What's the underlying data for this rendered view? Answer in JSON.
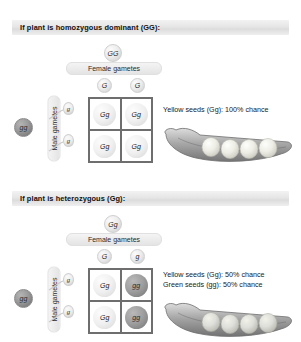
{
  "meta": {
    "background": "#ffffff",
    "header_bar_color": "#e6e6e6",
    "grid_line_color": "#6e6e6e",
    "dominant_allele_fill": "#ececec",
    "recessive_allele_fill": "#9a9a9a"
  },
  "panels": [
    {
      "id": "homozygous-dominant",
      "header": "If plant is homozygous dominant (GG):",
      "header_plain": "If plant is homozygous dominant (GG):",
      "female": {
        "parent_genotype": "GG",
        "parent_shade": "light",
        "label": "Female gametes",
        "gametes": [
          {
            "allele": "G",
            "shade": "light"
          },
          {
            "allele": "G",
            "shade": "light"
          }
        ]
      },
      "male": {
        "parent_genotype": "gg",
        "parent_shade": "dark",
        "label": "Male gametes",
        "gametes": [
          {
            "allele": "g",
            "shade": "light"
          },
          {
            "allele": "g",
            "shade": "light"
          }
        ]
      },
      "punnett": {
        "rows": [
          [
            {
              "genotype": "Gg",
              "shade": "light"
            },
            {
              "genotype": "Gg",
              "shade": "light"
            }
          ],
          [
            {
              "genotype": "Gg",
              "shade": "light"
            },
            {
              "genotype": "Gg",
              "shade": "light"
            }
          ]
        ]
      },
      "results": [
        {
          "text": "Yellow seeds (Gg): 100% chance",
          "phenotype": "Yellow seeds",
          "genotype": "Gg",
          "chance": "100%"
        }
      ],
      "pod": {
        "seed_count": 4,
        "seed_shade": "yellow"
      }
    },
    {
      "id": "heterozygous",
      "header": "If plant is heterozygous (Gg):",
      "header_plain": "If plant is heterozygous (Gg):",
      "female": {
        "parent_genotype": "Gg",
        "parent_shade": "light",
        "label": "Female gametes",
        "gametes": [
          {
            "allele": "G",
            "shade": "light"
          },
          {
            "allele": "g",
            "shade": "light"
          }
        ]
      },
      "male": {
        "parent_genotype": "gg",
        "parent_shade": "dark",
        "label": "Male gametes",
        "gametes": [
          {
            "allele": "g",
            "shade": "light"
          },
          {
            "allele": "g",
            "shade": "light"
          }
        ]
      },
      "punnett": {
        "rows": [
          [
            {
              "genotype": "Gg",
              "shade": "light"
            },
            {
              "genotype": "gg",
              "shade": "dark"
            }
          ],
          [
            {
              "genotype": "Gg",
              "shade": "light"
            },
            {
              "genotype": "gg",
              "shade": "dark"
            }
          ]
        ]
      },
      "results": [
        {
          "text": "Yellow seeds (Gg): 50% chance",
          "phenotype": "Yellow seeds",
          "genotype": "Gg",
          "chance": "50%"
        },
        {
          "text": "Green seeds (gg): 50% chance",
          "phenotype": "Green seeds",
          "genotype": "gg",
          "chance": "50%"
        }
      ],
      "pod": {
        "seed_count": 4,
        "seed_shade": "green"
      }
    }
  ]
}
